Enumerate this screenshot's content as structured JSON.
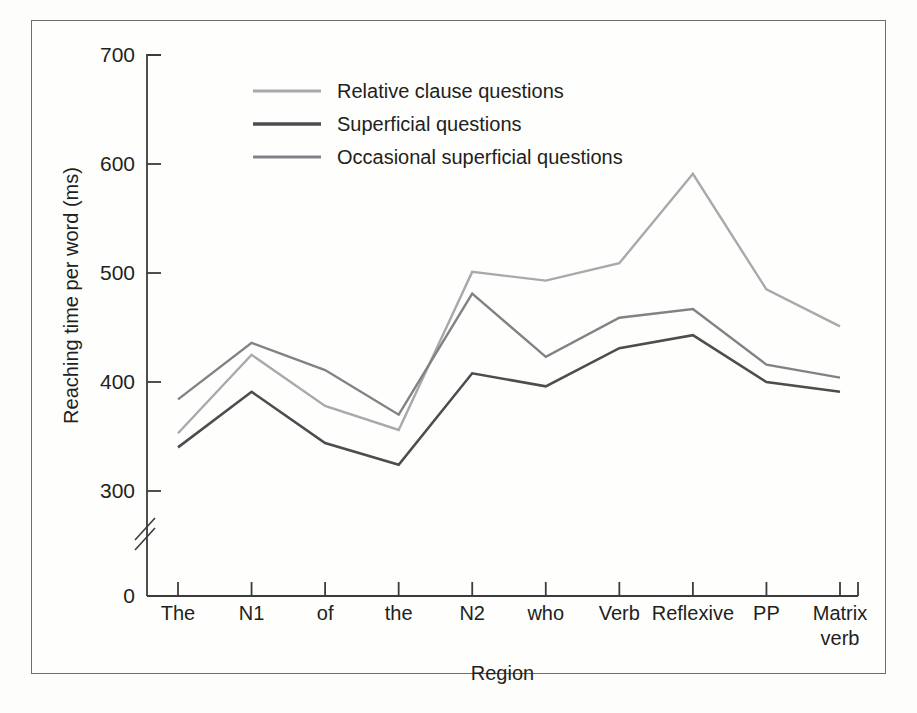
{
  "figure": {
    "background_color": "#fdfdfb",
    "frame_color": "#6d6e71"
  },
  "chart_data": {
    "type": "line",
    "title": "",
    "xlabel": "Region",
    "ylabel": "Reaching time per word (ms)",
    "categories": [
      "The",
      "N1",
      "of",
      "the",
      "N2",
      "who",
      "Verb",
      "Reflexive",
      "PP",
      "Matrix verb"
    ],
    "ytick_labels": [
      "0",
      "300",
      "400",
      "500",
      "600",
      "700"
    ],
    "ytick_values": [
      0,
      300,
      400,
      500,
      600,
      700
    ],
    "ylim": [
      300,
      700
    ],
    "axis_break": true,
    "grid": false,
    "legend_position": "top-left-inside",
    "series": [
      {
        "name": "Relative clause questions",
        "color": "#a7a9ac",
        "values": [
          353,
          425,
          378,
          356,
          501,
          493,
          509,
          591,
          485,
          451
        ]
      },
      {
        "name": "Superficial questions",
        "color": "#4d4d4f",
        "values": [
          340,
          391,
          344,
          324,
          408,
          396,
          431,
          443,
          400,
          391
        ]
      },
      {
        "name": "Occasional superficial questions",
        "color": "#808285",
        "values": [
          384,
          436,
          411,
          370,
          481,
          423,
          459,
          467,
          416,
          404
        ]
      }
    ]
  },
  "legend": {
    "entries": [
      {
        "label": "Relative clause questions",
        "color": "#a7a9ac"
      },
      {
        "label": "Superficial questions",
        "color": "#4d4d4f"
      },
      {
        "label": "Occasional superficial questions",
        "color": "#808285"
      }
    ]
  }
}
